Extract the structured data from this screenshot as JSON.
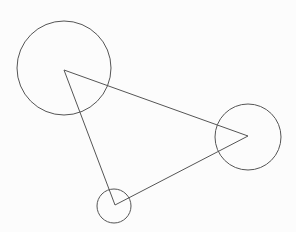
{
  "diagram": {
    "width": 296,
    "height": 232,
    "background": "#fcfcfc",
    "stroke": "#555555",
    "triangle": {
      "vertices": [
        [
          64,
          70
        ],
        [
          248,
          136
        ],
        [
          115,
          205
        ]
      ]
    },
    "circles": [
      {
        "name": "large-circle",
        "cx": 64,
        "cy": 68,
        "r": 47
      },
      {
        "name": "medium-circle",
        "cx": 248,
        "cy": 137,
        "r": 33
      },
      {
        "name": "small-circle",
        "cx": 114,
        "cy": 206,
        "r": 17
      }
    ]
  }
}
